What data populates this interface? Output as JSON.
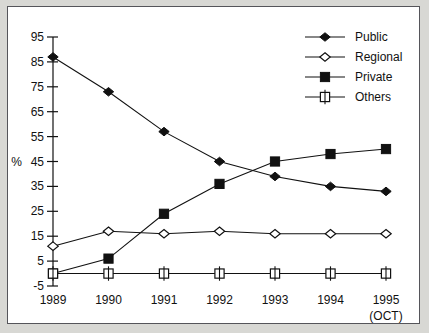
{
  "chart_data": {
    "type": "line",
    "title": "",
    "xlabel": "",
    "ylabel": "%",
    "x_note": "(OCT)",
    "categories": [
      "1989",
      "1990",
      "1991",
      "1992",
      "1993",
      "1994",
      "1995"
    ],
    "ylim": [
      -5,
      95
    ],
    "yticks": [
      95,
      85,
      75,
      65,
      55,
      45,
      35,
      25,
      15,
      5,
      -5
    ],
    "grid": false,
    "legend_position": "top-right",
    "series": [
      {
        "name": "Public",
        "marker": "filled-diamond",
        "values": [
          87,
          73,
          57,
          45,
          39,
          35,
          33
        ]
      },
      {
        "name": "Regional",
        "marker": "open-diamond",
        "values": [
          11,
          17,
          16,
          17,
          16,
          16,
          16
        ]
      },
      {
        "name": "Private",
        "marker": "filled-square",
        "values": [
          0,
          6,
          24,
          36,
          45,
          48,
          50
        ]
      },
      {
        "name": "Others",
        "marker": "open-square",
        "values": [
          0,
          0,
          0,
          0,
          0,
          0,
          0
        ]
      }
    ]
  },
  "colors": {
    "ink": "#111111",
    "page": "#ffffff",
    "surround": "#d8d8d4",
    "frame": "#55555a"
  }
}
